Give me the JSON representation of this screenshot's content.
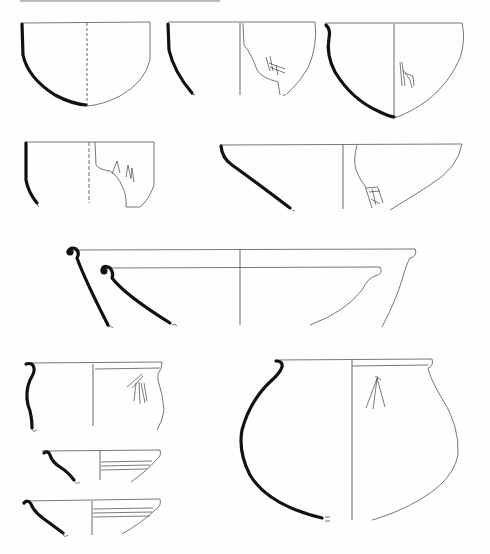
{
  "page": {
    "header_text": "",
    "header_visible": "truncated",
    "content_type": "pottery profile drawings",
    "figures": [
      {
        "id": "bowl-1",
        "shape": "hemispherical bowl",
        "row": 1,
        "position": "left",
        "decoration": "none"
      },
      {
        "id": "bowl-2",
        "shape": "hemispherical bowl fragment",
        "row": 1,
        "position": "center",
        "decoration": "incised marks on sherd"
      },
      {
        "id": "bowl-3",
        "shape": "carinated bowl",
        "row": 1,
        "position": "right",
        "decoration": "incised vertical marks"
      },
      {
        "id": "cup-4",
        "shape": "straight-sided cup fragment",
        "row": 2,
        "position": "left",
        "decoration": "incised chevrons"
      },
      {
        "id": "bowl-5",
        "shape": "wide conical bowl",
        "row": 2,
        "position": "right",
        "decoration": "incised marks on sherd"
      },
      {
        "id": "basin-6",
        "shape": "large flared basin with rolled rim (two profiles)",
        "row": 3,
        "position": "center",
        "decoration": "none"
      },
      {
        "id": "jar-7",
        "shape": "small necked jar",
        "row": 4,
        "position": "left",
        "decoration": "incised lines"
      },
      {
        "id": "bowl-8",
        "shape": "shallow bowl with grooves",
        "row": 5,
        "position": "left",
        "decoration": "horizontal grooves"
      },
      {
        "id": "bowl-9",
        "shape": "shallow bowl with grooves",
        "row": 6,
        "position": "left",
        "decoration": "horizontal grooves"
      },
      {
        "id": "jar-10",
        "shape": "globular jar with everted rim",
        "row": 4,
        "position": "right",
        "decoration": "incised branching mark"
      }
    ]
  }
}
